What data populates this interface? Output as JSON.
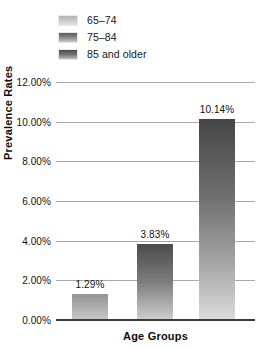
{
  "chart_data": {
    "type": "bar",
    "title": "",
    "xlabel": "Age Groups",
    "ylabel": "Prevalence Rates",
    "categories": [
      "65–74",
      "75–84",
      "85 and older"
    ],
    "values": [
      1.29,
      3.83,
      10.14
    ],
    "value_labels": [
      "1.29%",
      "3.83%",
      "10.14%"
    ],
    "ylim": [
      0,
      12
    ],
    "ytick_labels": [
      "0.00%",
      "2.00%",
      "4.00%",
      "6.00%",
      "8.00%",
      "10.00%",
      "12.00%"
    ],
    "ytick_values": [
      0,
      2,
      4,
      6,
      8,
      10,
      12
    ],
    "xtick_labels": [],
    "grid": true,
    "legend_position": "top-left",
    "legend": [
      {
        "label": "65–74",
        "swatch": "legend-swatch-65-74",
        "color": "#b4b4b4"
      },
      {
        "label": "75–84",
        "swatch": "legend-swatch-75-84",
        "color": "#5c5c5c"
      },
      {
        "label": "85 and older",
        "swatch": "legend-swatch-85-and-older",
        "color": "#4a4a4a"
      }
    ],
    "colors": {
      "bar_top_1": "#959595",
      "bar_top_2": "#4b4b4b",
      "bar_top_3": "#464646",
      "gridline": "#a9a9a9",
      "axis": "#3a3a3a",
      "text": "#111111",
      "background": "#ffffff"
    }
  }
}
